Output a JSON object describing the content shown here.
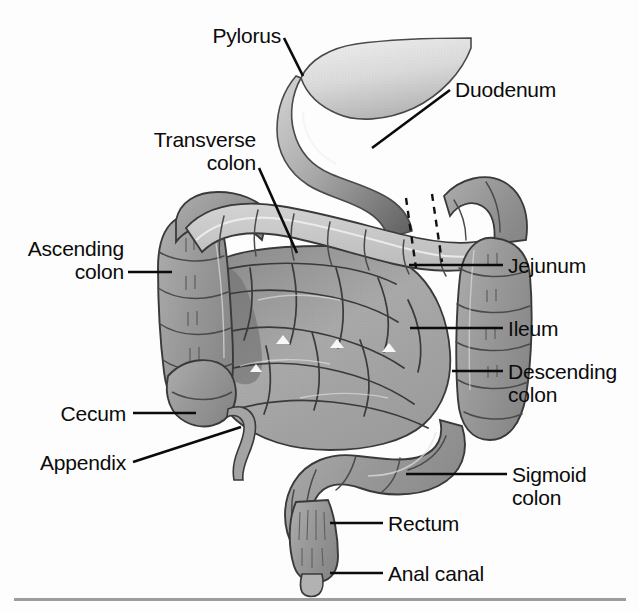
{
  "figure": {
    "background_color": "#fdfdfd",
    "line_color": "#0b0b0b",
    "rule_color": "#9d9d9d"
  },
  "palette": {
    "colon_mid": "#9a9a9a",
    "colon_light": "#c8c8c8",
    "small_intestine": "#a8a8a8",
    "small_intestine_shadow": "#7b7b7b",
    "stomach_light": "#e2e2e2",
    "duodenum_dark": "#6f6f6f",
    "outline": "#2b2b2b"
  },
  "labels": [
    {
      "id": "pylorus",
      "text": "Pylorus",
      "line2": "",
      "side": "left",
      "x": 215,
      "y": 24
    },
    {
      "id": "duodenum",
      "text": "Duodenum",
      "line2": "",
      "side": "right",
      "x": 455,
      "y": 78
    },
    {
      "id": "transverse-colon",
      "text": "Transverse",
      "line2": "colon",
      "side": "left",
      "x": 145,
      "y": 128
    },
    {
      "id": "ascending-colon",
      "text": "Ascending",
      "line2": "colon",
      "side": "left",
      "x": 18,
      "y": 237
    },
    {
      "id": "jejunum",
      "text": "Jejunum",
      "line2": "",
      "side": "right",
      "x": 508,
      "y": 254
    },
    {
      "id": "ileum",
      "text": "Ileum",
      "line2": "",
      "side": "right",
      "x": 508,
      "y": 317
    },
    {
      "id": "descending-colon",
      "text": "Descending",
      "line2": "colon",
      "side": "right",
      "x": 508,
      "y": 360
    },
    {
      "id": "cecum",
      "text": "Cecum",
      "line2": "",
      "side": "left",
      "x": 58,
      "y": 402
    },
    {
      "id": "appendix",
      "text": "Appendix",
      "line2": "",
      "side": "left",
      "x": 35,
      "y": 451
    },
    {
      "id": "sigmoid-colon",
      "text": "Sigmoid",
      "line2": "colon",
      "side": "right",
      "x": 512,
      "y": 463
    },
    {
      "id": "rectum",
      "text": "Rectum",
      "line2": "",
      "side": "right",
      "x": 388,
      "y": 512
    },
    {
      "id": "anal-canal",
      "text": "Anal canal",
      "line2": "",
      "side": "right",
      "x": 388,
      "y": 562
    }
  ],
  "leaders": [
    {
      "id": "pylorus-leader",
      "points": "284,38 303,76"
    },
    {
      "id": "duodenum-leader",
      "points": "450,90 372,148"
    },
    {
      "id": "transverse-colon-leader",
      "points": "259,168 297,253"
    },
    {
      "id": "ascending-colon-leader",
      "points": "128,272 172,272"
    },
    {
      "id": "jejunum-leader",
      "points": "409,265 503,265"
    },
    {
      "id": "ileum-leader",
      "points": "410,328 503,328"
    },
    {
      "id": "descending-colon-leader",
      "points": "452,371 503,371"
    },
    {
      "id": "cecum-leader",
      "points": "133,413 196,413"
    },
    {
      "id": "appendix-leader",
      "points": "133,462 241,427"
    },
    {
      "id": "sigmoid-colon-leader",
      "points": "406,474 507,474"
    },
    {
      "id": "rectum-leader",
      "points": "330,523 383,523"
    },
    {
      "id": "anal-canal-leader",
      "points": "330,573 383,573"
    }
  ],
  "structures": [
    {
      "id": "stomach-antrum",
      "name": "Stomach antrum / pyloric region"
    },
    {
      "id": "pylorus",
      "name": "Pylorus"
    },
    {
      "id": "duodenum",
      "name": "Duodenum (C-loop)"
    },
    {
      "id": "jejunum",
      "name": "Jejunum"
    },
    {
      "id": "ileum",
      "name": "Ileum"
    },
    {
      "id": "cecum",
      "name": "Cecum"
    },
    {
      "id": "appendix",
      "name": "Vermiform appendix"
    },
    {
      "id": "ascending-colon",
      "name": "Ascending colon"
    },
    {
      "id": "transverse-colon",
      "name": "Transverse colon"
    },
    {
      "id": "descending-colon",
      "name": "Descending colon"
    },
    {
      "id": "sigmoid-colon",
      "name": "Sigmoid colon"
    },
    {
      "id": "rectum",
      "name": "Rectum"
    },
    {
      "id": "anal-canal",
      "name": "Anal canal"
    }
  ]
}
